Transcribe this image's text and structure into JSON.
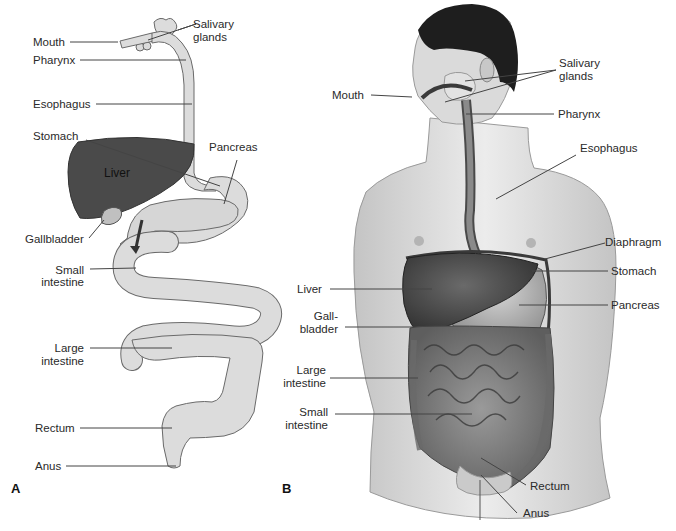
{
  "figure": {
    "panels": [
      {
        "id": "A",
        "letter": "A",
        "style": "schematic",
        "labels": {
          "salivary_glands_1": "Salivary",
          "salivary_glands_2": "glands",
          "mouth": "Mouth",
          "pharynx": "Pharynx",
          "esophagus": "Esophagus",
          "stomach": "Stomach",
          "pancreas": "Pancreas",
          "liver": "Liver",
          "gallbladder": "Gallbladder",
          "small_intestine_1": "Small",
          "small_intestine_2": "intestine",
          "large_intestine_1": "Large",
          "large_intestine_2": "intestine",
          "rectum": "Rectum",
          "anus": "Anus"
        }
      },
      {
        "id": "B",
        "letter": "B",
        "style": "illustrated-torso",
        "labels": {
          "salivary_glands_1": "Salivary",
          "salivary_glands_2": "glands",
          "mouth": "Mouth",
          "pharynx": "Pharynx",
          "esophagus": "Esophagus",
          "diaphragm": "Diaphragm",
          "stomach": "Stomach",
          "pancreas": "Pancreas",
          "liver": "Liver",
          "gallbladder_1": "Gall-",
          "gallbladder_2": "bladder",
          "large_intestine_1": "Large",
          "large_intestine_2": "intestine",
          "small_intestine_1": "Small",
          "small_intestine_2": "intestine",
          "rectum": "Rectum",
          "anus": "Anus"
        }
      }
    ],
    "colors": {
      "organ_fill": "#dcdcdc",
      "organ_stroke": "#6a6a6a",
      "liver_dark": "#4a4a4a",
      "skin": "#d8d8d8",
      "hair": "#1e1e1e",
      "leader_line": "#444444"
    }
  }
}
